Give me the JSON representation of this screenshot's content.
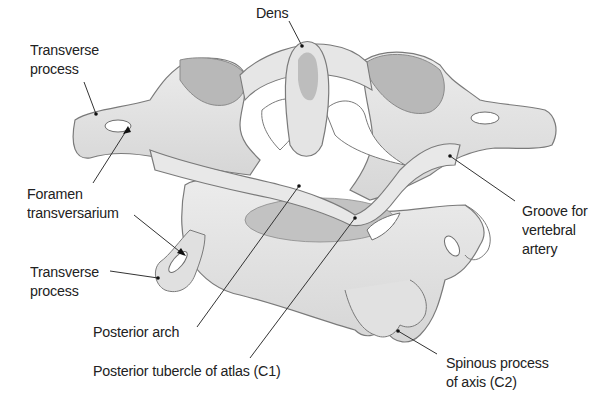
{
  "figure": {
    "colors": {
      "bone_fill": "#e4e4e4",
      "bone_shade": "#c9c9c9",
      "articular_facet": "#b4b4b4",
      "outline": "#7a7a7a",
      "leader_line": "#333333",
      "text": "#222222",
      "background": "#ffffff"
    },
    "labels": {
      "dens": "Dens",
      "transverse_process_top": "Transverse\nprocess",
      "foramen_transversarium": "Foramen\ntransversarium",
      "transverse_process_bottom": "Transverse\nprocess",
      "posterior_arch": "Posterior arch",
      "posterior_tubercle": "Posterior tubercle of atlas (C1)",
      "spinous_process": "Spinous process\nof axis (C2)",
      "groove_vertebral_artery": "Groove for\nvertebral\nartery"
    }
  }
}
